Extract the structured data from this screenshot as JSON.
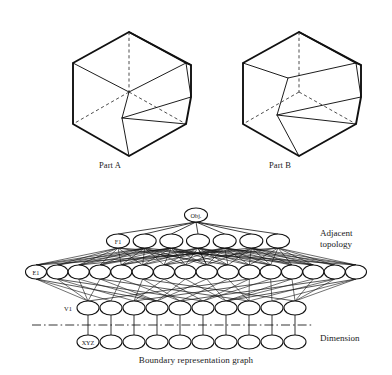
{
  "figure": {
    "type": "diagram",
    "background_color": "#ffffff",
    "ink_color": "#111111",
    "caption": "Boundary representation graph"
  },
  "parts": [
    {
      "id": "part-a",
      "label": "Part A",
      "description": "Isometric solid block with chamfered upper-right corner and inclined front face"
    },
    {
      "id": "part-b",
      "label": "Part B",
      "description": "Isometric solid block with a large inclined ramp face across the front"
    }
  ],
  "graph": {
    "caption": "Boundary representation graph",
    "annotations": {
      "adjacent_topology_line1": "Adjacent",
      "adjacent_topology_line2": "topology",
      "dimension": "Dimension"
    },
    "rows": [
      {
        "id": "obj-row",
        "label": "Obj.",
        "label_inside": true,
        "node_count": 1,
        "y": 215,
        "x_start": 196,
        "x_end": 196,
        "rx": 11.5,
        "ry": 7.0
      },
      {
        "id": "face-row",
        "label": "F1",
        "label_inside": true,
        "node_count": 7,
        "y": 241,
        "x_start": 118,
        "x_end": 278,
        "rx": 11.5,
        "ry": 7.0
      },
      {
        "id": "edge-row",
        "label": "E1",
        "label_inside": true,
        "node_count": 16,
        "y": 272,
        "x_start": 36,
        "x_end": 356,
        "rx": 10.5,
        "ry": 7.0
      },
      {
        "id": "vertex-row",
        "label": "V1",
        "label_inside": false,
        "node_count": 10,
        "y": 308,
        "x_start": 88,
        "x_end": 295,
        "rx": 11.0,
        "ry": 7.0
      },
      {
        "id": "coord-row",
        "label": "XYZ",
        "label_inside": true,
        "node_count": 10,
        "y": 342,
        "x_start": 88,
        "x_end": 295,
        "rx": 11.0,
        "ry": 7.0
      }
    ],
    "divider": {
      "id": "dimension-divider",
      "style": "dash-dot",
      "y": 325,
      "x_start": 32,
      "x_end": 312
    }
  }
}
